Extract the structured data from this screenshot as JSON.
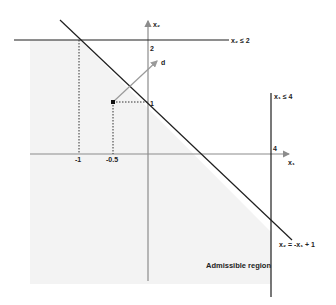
{
  "diagram": {
    "colors": {
      "background": "#ffffff",
      "region_fill": "#f3f3f3",
      "constraint_line": "#1e1e1e",
      "axis": "#8c8c8c",
      "direction_arrow": "#9a9a9a",
      "guides": "#333333",
      "point": "#111111"
    },
    "axes": {
      "x_label": "x₁",
      "y_label": "x₂"
    },
    "ticks": {
      "x_minus1": "-1",
      "x_minus05": "-0.5",
      "x_4": "4",
      "y_2": "2",
      "y_1": "1"
    },
    "constraints": {
      "c1": "x₂ ≤ 2",
      "c2": "x₁ ≤ 4",
      "c3": "x₂ = -x₁ + 1"
    },
    "direction_label": "d",
    "region_label": "Admissible region",
    "point": {
      "x1": -0.5,
      "x2": 1
    }
  }
}
